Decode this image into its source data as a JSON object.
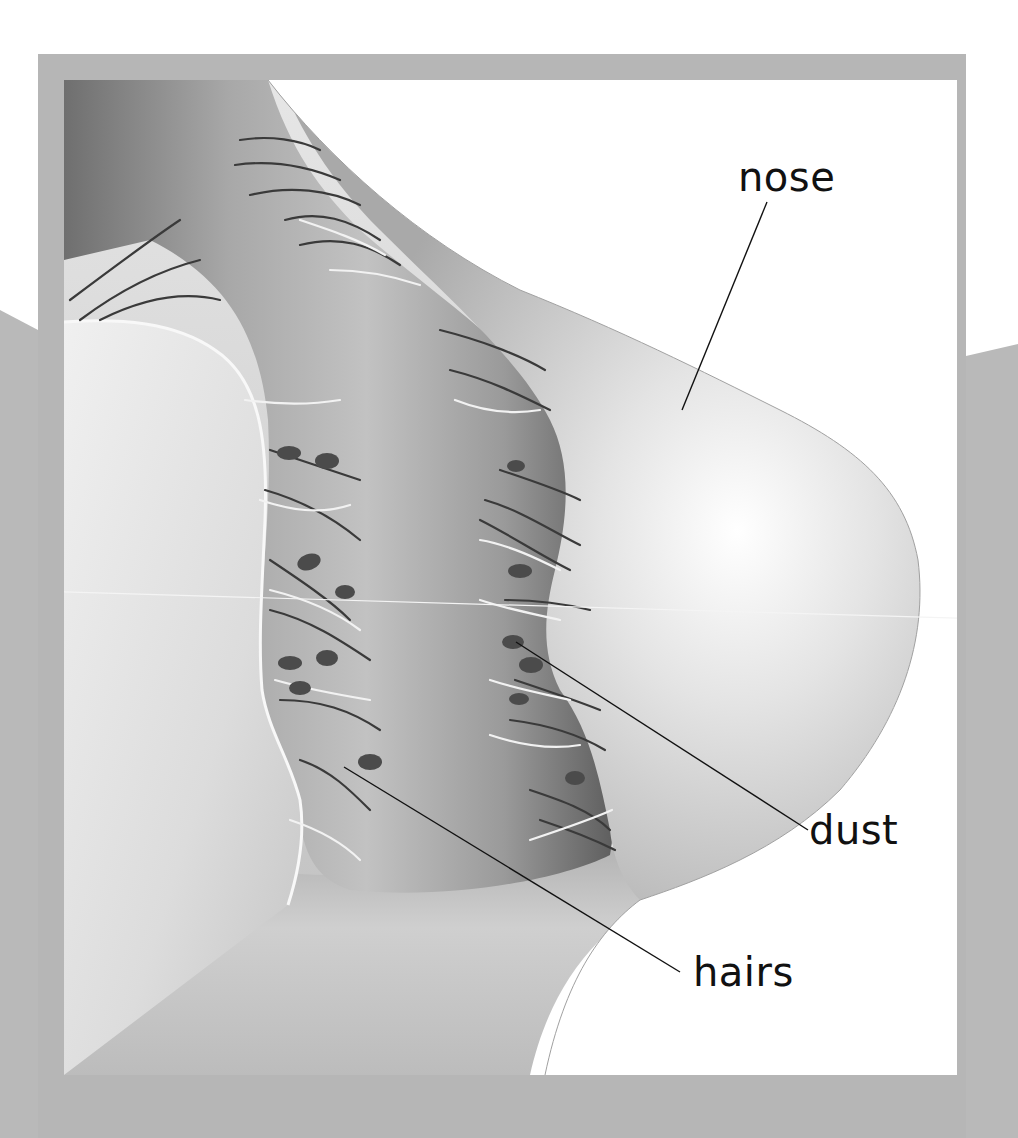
{
  "diagram": {
    "colors": {
      "frame": "#b5b5b5",
      "panel": "#ffffff",
      "skin_light": "#e6e6e6",
      "skin_mid": "#c8c8c8",
      "nostril_dark": "#7a7a7a",
      "hair_dark": "#3a3a3a",
      "hair_light": "#f2f2f2",
      "dust": "#4a4a4a",
      "leader_line": "#111111"
    },
    "labels": [
      {
        "id": "nose",
        "text": "nose"
      },
      {
        "id": "dust",
        "text": "dust"
      },
      {
        "id": "hairs",
        "text": "hairs"
      }
    ]
  }
}
